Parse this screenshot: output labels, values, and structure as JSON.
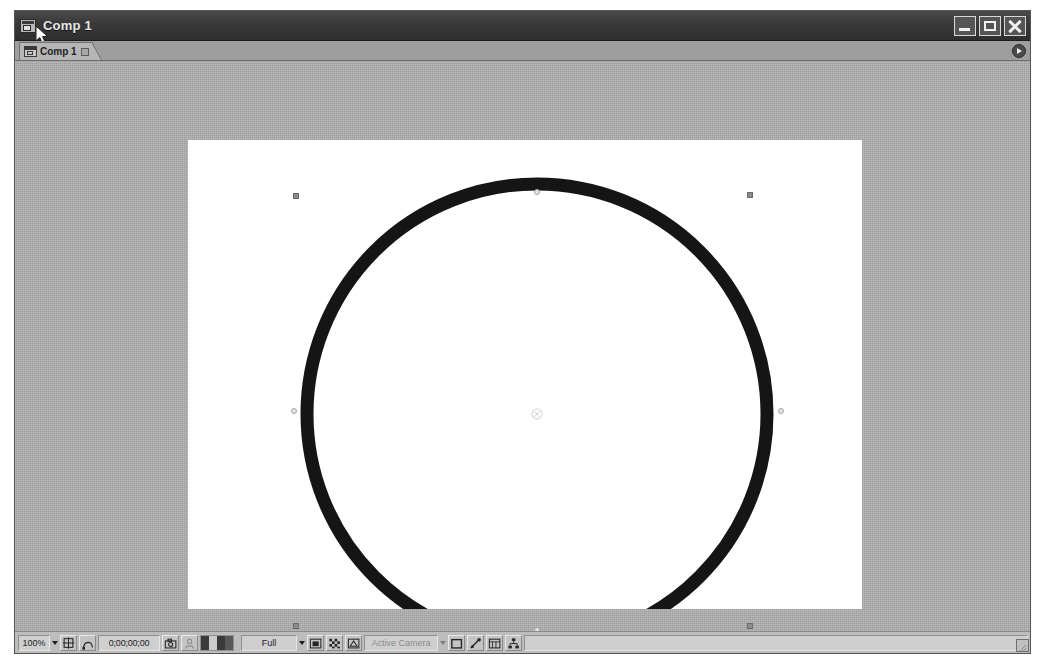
{
  "window": {
    "title": "Comp 1",
    "title_icon": "composition-icon",
    "controls": {
      "minimize_label": "Minimize",
      "maximize_label": "Maximize",
      "close_label": "Close"
    }
  },
  "tab_bar": {
    "tabs": [
      {
        "label": "Comp 1",
        "icon": "composition-icon",
        "lock_icon": "lock-icon",
        "active": true
      }
    ],
    "panel_menu_label": "Panel Menu"
  },
  "viewer": {
    "background": "#acacac",
    "comp_background": "#ffffff",
    "layer": {
      "name": "circle-shape",
      "stroke_color": "#1a1a1a",
      "fill_color": "none",
      "selected": true
    },
    "anchor_point_label": "Anchor Point",
    "handles": {
      "corner_color": "#8c8c8c",
      "mid_color": "#e4e4e4"
    }
  },
  "toolbar": {
    "zoom_level": "100%",
    "zoom_caret": "chevron-down-icon",
    "grid_guides_label": "Choose grid and guide options",
    "mask_label": "Toggle mask and shape path visibility",
    "timecode": "0;00;00;00",
    "snapshot_label": "Take snapshot",
    "show_snapshot_label": "Show snapshot",
    "channels": [
      {
        "name": "red",
        "color": "#3a3a3a"
      },
      {
        "name": "green",
        "color": "#cfcfcf"
      },
      {
        "name": "blue",
        "color": "#3a3a3a"
      },
      {
        "name": "alpha",
        "color": "#5a5a5a"
      }
    ],
    "resolution": "Full",
    "resolution_caret": "chevron-down-icon",
    "region_of_interest_label": "Region of Interest",
    "transparency_grid_label": "Toggle transparency grid",
    "alpha_boundary_label": "Alpha boundary",
    "camera_view": "Active Camera",
    "camera_caret": "chevron-down-icon",
    "camera_disabled": true,
    "view_layout_label": "1 View",
    "fast_previews_label": "Fast Previews",
    "timeline_label": "Timeline",
    "flowchart_label": "Comp Flowchart",
    "resize_grip_label": "Resize"
  }
}
